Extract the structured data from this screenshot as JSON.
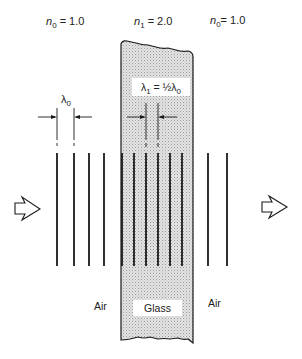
{
  "header": {
    "left_index": {
      "symbol": "n",
      "subscript": "0",
      "equals": " = 1.0"
    },
    "center_index": {
      "symbol": "n",
      "subscript": "1",
      "equals": " = 2.0"
    },
    "right_index": {
      "symbol": "n",
      "subscript": "0",
      "equals": "= 1.0"
    }
  },
  "dimensions": {
    "lambda0": {
      "symbol": "λ",
      "subscript": "0"
    },
    "lambda1": {
      "symbol": "λ",
      "subscript": "1",
      "equals": " = ½λ",
      "rhs_subscript": "0"
    }
  },
  "regions": {
    "left": "Air",
    "center": "Glass",
    "right": "Air"
  },
  "icons": {
    "incoming": "hollow-arrow-right-icon",
    "outgoing": "hollow-arrow-right-icon"
  },
  "wavefronts": {
    "air_left_x": [
      57,
      74,
      89,
      104
    ],
    "glass_x": [
      122,
      134,
      147,
      159,
      171,
      183
    ],
    "air_right_x": [
      208,
      227
    ],
    "top_y": 153,
    "bottom_y": 266
  },
  "colors": {
    "line": "#1a1a1a",
    "glass_fill": "#d9d9d9",
    "background": "#ffffff"
  }
}
